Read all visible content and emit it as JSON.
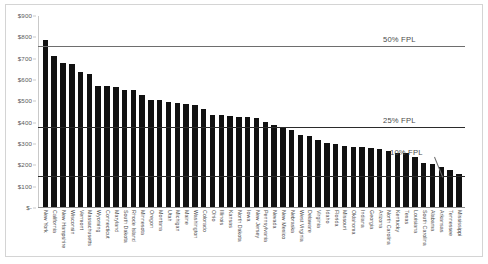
{
  "chart_data": {
    "type": "bar",
    "title": "",
    "subtitle": "",
    "xlabel": "",
    "ylabel": "",
    "ylim": [
      0,
      900
    ],
    "ytick_values": [
      0,
      100,
      200,
      300,
      400,
      500,
      600,
      700,
      800,
      900
    ],
    "ytick_labels": [
      "$-",
      "$100",
      "$200",
      "$300",
      "$400",
      "$500",
      "$600",
      "$700",
      "$800",
      "$900"
    ],
    "grid": false,
    "legend": "none",
    "bar_color": "#111111",
    "categories": [
      "New York",
      "California",
      "New Hampshire",
      "Wisconsin",
      "Vermont",
      "Massachusetts",
      "Wyoming",
      "Connecticut",
      "Maryland",
      "South Dakota",
      "Rhode Island",
      "Minnesota",
      "Oregon",
      "Montana",
      "Utah",
      "Michigan",
      "Maine",
      "Washington",
      "Colorado",
      "Ohio",
      "Illinois",
      "Kansas",
      "North Dakota",
      "Iowa",
      "New Jersey",
      "Pennsylvania",
      "Nevada",
      "New Mexico",
      "Nebraska",
      "West Virginia",
      "Delaware",
      "Virginia",
      "Idaho",
      "Florida",
      "Missouri",
      "Oklahoma",
      "Indiana",
      "Georgia",
      "Arizona",
      "North Carolina",
      "Kentucky",
      "Texas",
      "Louisiana",
      "South Carolina",
      "Alabama",
      "Arkansas",
      "Tennessee",
      "Mississippi"
    ],
    "values": [
      789,
      714,
      678,
      673,
      638,
      630,
      572,
      572,
      569,
      551,
      551,
      531,
      505,
      504,
      499,
      494,
      486,
      484,
      462,
      437,
      435,
      429,
      427,
      427,
      423,
      404,
      387,
      381,
      368,
      340,
      336,
      321,
      307,
      298,
      291,
      288,
      285,
      281,
      277,
      268,
      258,
      256,
      237,
      210,
      207,
      194,
      178,
      158
    ],
    "reference_lines": [
      {
        "label": "50% FPL",
        "value": 760
      },
      {
        "label": "25% FPL",
        "value": 380
      },
      {
        "label": "10% FPL",
        "value": 152
      }
    ]
  }
}
